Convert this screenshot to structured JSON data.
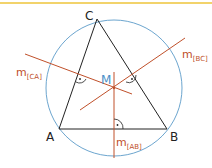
{
  "diagram": {
    "type": "circumcircle-construction",
    "colors": {
      "top_rule": "#f2d36b",
      "circle": "#5b9bc8",
      "triangle": "#222222",
      "bisector": "#c0502a",
      "center_label": "#4a90c8",
      "bisector_label": "#c0502a",
      "vertex_label": "#222222"
    },
    "vertices": {
      "A": {
        "label": "A",
        "x": 59,
        "y": 129
      },
      "B": {
        "label": "B",
        "x": 167,
        "y": 129
      },
      "C": {
        "label": "C",
        "x": 97,
        "y": 19
      }
    },
    "circumcenter": {
      "label": "M",
      "x": 114,
      "y": 88
    },
    "circle": {
      "cx": 114,
      "cy": 88,
      "r": 68
    },
    "bisectors": [
      {
        "id": "m_CA",
        "label_base": "m",
        "label_sub": "[CA]",
        "x1": 25,
        "y1": 54,
        "x2": 132,
        "y2": 94
      },
      {
        "id": "m_BC",
        "label_base": "m",
        "label_sub": "[BC]",
        "x1": 80,
        "y1": 110,
        "x2": 185,
        "y2": 38
      },
      {
        "id": "m_AB",
        "label_base": "m",
        "label_sub": "[AB]",
        "x1": 114,
        "y1": 72,
        "x2": 114,
        "y2": 158
      }
    ],
    "labels": {
      "A": "A",
      "B": "B",
      "C": "C",
      "M": "M",
      "m_CA_base": "m",
      "m_CA_sub": "[CA]",
      "m_BC_base": "m",
      "m_BC_sub": "[BC]",
      "m_AB_base": "m",
      "m_AB_sub": "[AB]"
    },
    "right_angle_marks": [
      "midpoint-CA",
      "midpoint-BC",
      "midpoint-AB"
    ]
  }
}
